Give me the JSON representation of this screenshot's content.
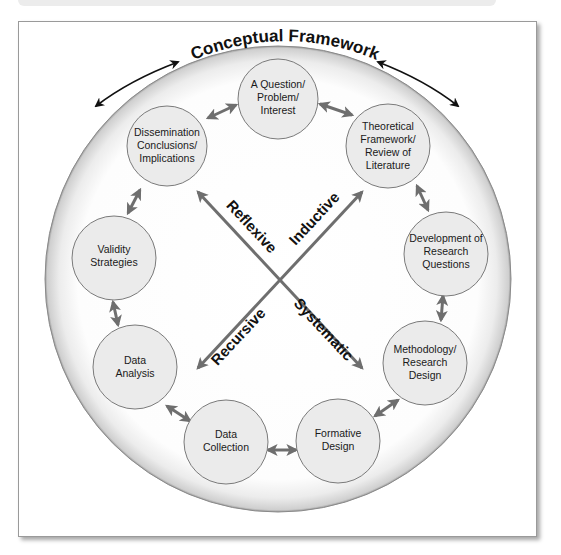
{
  "diagram": {
    "title": "Conceptual Framework",
    "colors": {
      "outer_circle_fill": "#f2f2f2",
      "outer_circle_edge": "#8a8a8a",
      "node_fill": "#ebebeb",
      "node_stroke": "#7a7a7a",
      "cycle_arrow": "#6e6e6e",
      "cross_arrow": "#6e6e6e",
      "title_arrow": "#111111"
    },
    "nodes": [
      {
        "id": "question",
        "lines": [
          "A Question/",
          "Problem/",
          "Interest"
        ]
      },
      {
        "id": "theoretical",
        "lines": [
          "Theoretical",
          "Framework/",
          "Review of",
          "Literature"
        ]
      },
      {
        "id": "development",
        "lines": [
          "Development of",
          "Research",
          "Questions"
        ]
      },
      {
        "id": "methodology",
        "lines": [
          "Methodology/",
          "Research",
          "Design"
        ]
      },
      {
        "id": "formative",
        "lines": [
          "Formative",
          "Design"
        ]
      },
      {
        "id": "collection",
        "lines": [
          "Data",
          "Collection"
        ]
      },
      {
        "id": "analysis",
        "lines": [
          "Data",
          "Analysis"
        ]
      },
      {
        "id": "validity",
        "lines": [
          "Validity",
          "Strategies"
        ]
      },
      {
        "id": "dissemination",
        "lines": [
          "Dissemination",
          "Conclusions/",
          "Implications"
        ]
      }
    ],
    "cross_labels": {
      "reflexive": "Reflexive",
      "inductive": "Inductive",
      "recursive": "Recursive",
      "systematic": "Systematic"
    }
  }
}
